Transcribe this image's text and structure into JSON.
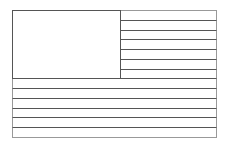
{
  "figure": {
    "type": "flag-outline",
    "stripe_count": 13,
    "canton_stripes": 7,
    "colors": {
      "background": "#ffffff",
      "line": "#555555",
      "border": "#999999"
    },
    "geometry": {
      "x": 12,
      "y": 10,
      "width": 204,
      "height": 127,
      "canton_width": 108
    }
  }
}
